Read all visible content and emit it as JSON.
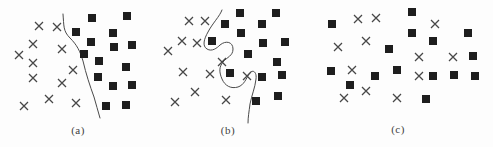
{
  "figure": {
    "background": "#fdfdfd",
    "cross_color": "#474747",
    "square_color": "#1e1e1e",
    "curve_color": "#4a4a4a",
    "label_color": "#3d3d3d",
    "canvas_width": 493,
    "canvas_height": 147
  },
  "chart_data": [
    {
      "type": "scatter",
      "id": "a",
      "label": "(a)",
      "label_pos": [
        78,
        130
      ],
      "legend": "none",
      "axes": "none",
      "boundary": "simple smooth curve separating crosses (left) from squares (right)",
      "boundary_path": "M 63 14 C 64 26 63 31 70 38 C 77 45 80 51 83 61 C 86 74 90 86 94 97 C 96 104 98 111 100 118",
      "series": [
        {
          "name": "class-cross",
          "marker": "x",
          "points": [
            [
              39,
              26
            ],
            [
              57,
              27
            ],
            [
              33,
              44
            ],
            [
              62,
              49
            ],
            [
              19,
              55
            ],
            [
              33,
              63
            ],
            [
              73,
              70
            ],
            [
              33,
              78
            ],
            [
              62,
              83
            ],
            [
              49,
              99
            ],
            [
              24,
              106
            ],
            [
              76,
              103
            ]
          ]
        },
        {
          "name": "class-square",
          "marker": "filled-square",
          "points": [
            [
              92,
              18
            ],
            [
              127,
              16
            ],
            [
              76,
              32
            ],
            [
              113,
              33
            ],
            [
              91,
              42
            ],
            [
              114,
              47
            ],
            [
              132,
              45
            ],
            [
              84,
              54
            ],
            [
              99,
              61
            ],
            [
              126,
              67
            ],
            [
              98,
              77
            ],
            [
              113,
              86
            ],
            [
              132,
              85
            ],
            [
              106,
              106
            ],
            [
              126,
              105
            ]
          ]
        }
      ]
    },
    {
      "type": "scatter",
      "id": "b",
      "label": "(b)",
      "label_pos": [
        228,
        130
      ],
      "legend": "none",
      "axes": "none",
      "boundary": "wiggly overfit curve snaking around individual points",
      "boundary_path": "M 222 10 C 220 16 212 24 208 32 C 204 39 202 46 207 49 C 212 52 217 48 220 45 C 226 40 233 42 233 49 C 233 56 227 57 223 62 C 219 67 219 72 222 79 C 225 86 231 89 238 87 C 244 85 246 79 249 74 C 252 69 257 71 256 79 C 255 88 252 94 250 104 C 249 112 248 117 248 123",
      "series": [
        {
          "name": "class-cross",
          "marker": "x",
          "points": [
            [
              189,
              21
            ],
            [
              205,
              21
            ],
            [
              182,
              41
            ],
            [
              197,
              43
            ],
            [
              168,
              51
            ],
            [
              222,
              62
            ],
            [
              183,
              72
            ],
            [
              210,
              74
            ],
            [
              247,
              76
            ],
            [
              195,
              92
            ],
            [
              175,
              102
            ],
            [
              226,
              100
            ]
          ]
        },
        {
          "name": "class-square",
          "marker": "filled-square",
          "points": [
            [
              240,
              13
            ],
            [
              276,
              13
            ],
            [
              225,
              24
            ],
            [
              262,
              24
            ],
            [
              241,
              33
            ],
            [
              212,
              41
            ],
            [
              263,
              43
            ],
            [
              285,
              42
            ],
            [
              248,
              54
            ],
            [
              277,
              62
            ],
            [
              230,
              73
            ],
            [
              262,
              77
            ],
            [
              282,
              75
            ],
            [
              256,
              101
            ],
            [
              278,
              96
            ]
          ]
        }
      ]
    },
    {
      "type": "scatter",
      "id": "c",
      "label": "(c)",
      "label_pos": [
        398,
        129
      ],
      "legend": "none",
      "axes": "none",
      "boundary": "no separating curve, classes interleaved",
      "boundary_path": "",
      "series": [
        {
          "name": "class-cross",
          "marker": "x",
          "points": [
            [
              358,
              19
            ],
            [
              376,
              18
            ],
            [
              435,
              24
            ],
            [
              366,
              41
            ],
            [
              338,
              47
            ],
            [
              419,
              57
            ],
            [
              453,
              57
            ],
            [
              352,
              70
            ],
            [
              419,
              76
            ],
            [
              366,
              91
            ],
            [
              344,
              98
            ],
            [
              397,
              98
            ]
          ]
        },
        {
          "name": "class-square",
          "marker": "filled-square",
          "points": [
            [
              412,
              12
            ],
            [
              332,
              24
            ],
            [
              412,
              33
            ],
            [
              468,
              33
            ],
            [
              433,
              41
            ],
            [
              389,
              49
            ],
            [
              473,
              56
            ],
            [
              331,
              71
            ],
            [
              397,
              70
            ],
            [
              375,
              76
            ],
            [
              433,
              76
            ],
            [
              454,
              75
            ],
            [
              475,
              76
            ],
            [
              350,
              85
            ],
            [
              426,
              99
            ]
          ]
        }
      ]
    }
  ]
}
